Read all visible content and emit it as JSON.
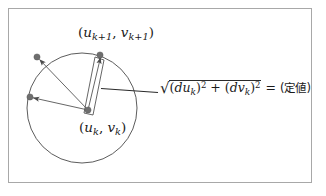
{
  "figure": {
    "title_present": false,
    "border_color": "#a8a8a8",
    "background_color": "#ffffff",
    "stroke_color": "#4a4a4a",
    "dot_color": "#7a7a7a",
    "text_color": "#1a1a1a"
  },
  "labels": {
    "next_point": {
      "open": "(",
      "u": "u",
      "u_sub": "k+1",
      "comma": ", ",
      "v": "v",
      "v_sub": "k+1",
      "close": ")",
      "plain": "(u_k+1, v_k+1)"
    },
    "current_point": {
      "open": "(",
      "u": "u",
      "u_sub": "k",
      "comma": ", ",
      "v": "v",
      "v_sub": "k",
      "close": ")",
      "plain": "(u_k, v_k)"
    }
  },
  "formula": {
    "radical_sign": "√",
    "term1_open": "(",
    "term1_d": "d",
    "term1_var": "u",
    "term1_sub": "k",
    "term1_close": ")",
    "term1_exp": "2",
    "plus": " + ",
    "term2_open": "(",
    "term2_d": "d",
    "term2_var": "v",
    "term2_sub": "k",
    "term2_close": ")",
    "term2_exp": "2",
    "equals": " = ",
    "result": "(定値)",
    "plain": "√((du_k)^2 + (dv_k)^2) = (定値)"
  },
  "geometry": {
    "circle": {
      "cx": 82,
      "cy": 108,
      "r": 55
    },
    "center_point": {
      "x": 88,
      "y": 110
    },
    "circle_points": [
      {
        "x": 100,
        "y": 55,
        "name": "point-top-right"
      },
      {
        "x": 37,
        "y": 57,
        "name": "point-upper-left"
      },
      {
        "x": 30,
        "y": 97,
        "name": "point-left"
      }
    ],
    "leader_line": {
      "x1": 104,
      "y1": 89,
      "x2": 158,
      "y2": 93
    },
    "band": {
      "p1": {
        "x": 84,
        "y": 113
      },
      "p2": {
        "x": 96,
        "y": 58
      },
      "p3": {
        "x": 104,
        "y": 60
      },
      "p4": {
        "x": 92,
        "y": 114
      }
    }
  }
}
